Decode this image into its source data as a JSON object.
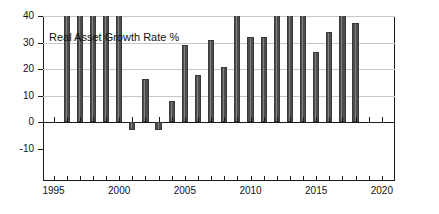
{
  "chart_data": {
    "type": "bar",
    "title": "Real Asset Growth Rate %",
    "xlabel": "",
    "ylabel": "",
    "xlim": [
      1994.2,
      2021.0
    ],
    "ylim": [
      -10,
      40
    ],
    "grid": true,
    "legend": "none",
    "yticks": [
      -10,
      0,
      10,
      20,
      30,
      40
    ],
    "ytick_labels": [
      "-10",
      "0",
      "10",
      "20",
      "30",
      "40"
    ],
    "xticks": [
      1995,
      2000,
      2005,
      2010,
      2015,
      2020
    ],
    "xtick_labels": [
      "1995",
      "2000",
      "2005",
      "2010",
      "2015",
      "2020"
    ],
    "bar_color": "#4d4d4d",
    "note": "Bars reaching the top of the axis are clipped at 40 (values exceed the axis maximum).",
    "categories": [
      1996,
      1997,
      1998,
      1999,
      2000,
      2001,
      2002,
      2003,
      2004,
      2005,
      2006,
      2007,
      2008,
      2009,
      2010,
      2011,
      2012,
      2013,
      2014,
      2015,
      2016,
      2017,
      2018
    ],
    "values": [
      40,
      40,
      40,
      40,
      40,
      -3,
      16.5,
      -3,
      8,
      29,
      18,
      31,
      21,
      40,
      32,
      32,
      40,
      40,
      40,
      26.5,
      34,
      40,
      37.5
    ],
    "clipped": [
      true,
      true,
      true,
      true,
      true,
      false,
      false,
      false,
      false,
      false,
      false,
      false,
      false,
      true,
      false,
      false,
      true,
      true,
      true,
      false,
      false,
      true,
      false
    ]
  },
  "axes": {
    "y_title": "",
    "x_title": ""
  }
}
